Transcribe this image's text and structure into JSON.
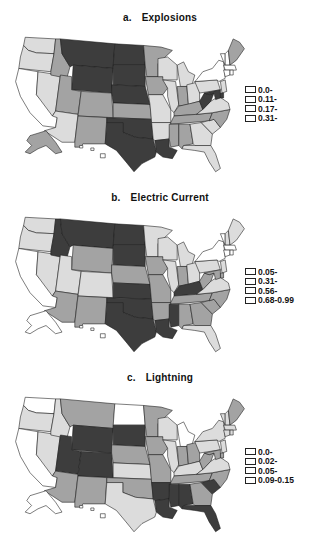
{
  "chart_data": [
    {
      "type": "choropleth-map",
      "panel": "a",
      "title": "Explosions",
      "legend": [
        "0.0-",
        "0.11-",
        "0.17-",
        "0.31-"
      ],
      "legend_colors": [
        "#ffffff",
        "#dcdcdc",
        "#a3a3a3",
        "#3d3d3d"
      ],
      "classes": {
        "WA": 1,
        "OR": 1,
        "CA": 0,
        "NV": 1,
        "ID": 2,
        "MT": 3,
        "WY": 3,
        "UT": 2,
        "AZ": 1,
        "CO": 2,
        "NM": 2,
        "ND": 3,
        "SD": 3,
        "NE": 3,
        "KS": 2,
        "OK": 3,
        "TX": 3,
        "MN": 2,
        "IA": 2,
        "MO": 1,
        "AR": 1,
        "LA": 3,
        "WI": 1,
        "IL": 1,
        "MI": 1,
        "IN": 2,
        "OH": 1,
        "KY": 2,
        "TN": 2,
        "MS": 2,
        "AL": 2,
        "GA": 1,
        "FL": 1,
        "SC": 1,
        "NC": 2,
        "VA": 1,
        "WV": 3,
        "PA": 1,
        "NY": 0,
        "VT": 0,
        "NH": 0,
        "ME": 2,
        "MA": 0,
        "CT": 0,
        "RI": 0,
        "NJ": 1,
        "DE": 3,
        "MD": 3,
        "AK": 2,
        "HI": 0
      }
    },
    {
      "type": "choropleth-map",
      "panel": "b",
      "title": "Electric Current",
      "legend": [
        "0.05-",
        "0.31-",
        "0.56-",
        "0.68-0.99"
      ],
      "legend_colors": [
        "#ffffff",
        "#dcdcdc",
        "#a3a3a3",
        "#3d3d3d"
      ],
      "classes": {
        "WA": 1,
        "OR": 1,
        "CA": 0,
        "NV": 1,
        "ID": 3,
        "MT": 3,
        "WY": 2,
        "UT": 1,
        "AZ": 2,
        "CO": 1,
        "NM": 2,
        "ND": 3,
        "SD": 3,
        "NE": 2,
        "KS": 3,
        "OK": 3,
        "TX": 3,
        "MN": 1,
        "IA": 2,
        "MO": 2,
        "AR": 2,
        "LA": 3,
        "WI": 1,
        "IL": 1,
        "MI": 1,
        "IN": 2,
        "OH": 1,
        "KY": 3,
        "TN": 2,
        "MS": 3,
        "AL": 2,
        "GA": 2,
        "FL": 1,
        "SC": 2,
        "NC": 2,
        "VA": 1,
        "WV": 2,
        "PA": 1,
        "NY": 0,
        "VT": 0,
        "NH": 1,
        "ME": 1,
        "MA": 0,
        "CT": 0,
        "RI": 0,
        "NJ": 1,
        "DE": 2,
        "MD": 2,
        "AK": 0,
        "HI": 0
      }
    },
    {
      "type": "choropleth-map",
      "panel": "c",
      "title": "Lightning",
      "legend": [
        "0.0-",
        "0.02-",
        "0.05-",
        "0.09-0.15"
      ],
      "legend_colors": [
        "#ffffff",
        "#dcdcdc",
        "#a3a3a3",
        "#3d3d3d"
      ],
      "classes": {
        "WA": 0,
        "OR": 1,
        "CA": 0,
        "NV": 1,
        "ID": 1,
        "MT": 2,
        "WY": 3,
        "UT": 3,
        "AZ": 2,
        "CO": 3,
        "NM": 2,
        "ND": 0,
        "SD": 3,
        "NE": 2,
        "KS": 1,
        "OK": 2,
        "TX": 1,
        "MN": 2,
        "IA": 2,
        "MO": 2,
        "AR": 3,
        "LA": 3,
        "WI": 1,
        "IL": 1,
        "MI": 0,
        "IN": 2,
        "OH": 2,
        "KY": 1,
        "TN": 2,
        "MS": 3,
        "AL": 3,
        "GA": 2,
        "FL": 3,
        "SC": 3,
        "NC": 2,
        "VA": 1,
        "WV": 2,
        "PA": 1,
        "NY": 1,
        "VT": 1,
        "NH": 1,
        "ME": 2,
        "MA": 1,
        "CT": 1,
        "RI": 1,
        "NJ": 1,
        "DE": 2,
        "MD": 2,
        "AK": 0,
        "HI": 0
      }
    }
  ],
  "panels": [
    {
      "letter": "a.",
      "title": "Explosions",
      "legend": [
        "0.0-",
        "0.11-",
        "0.17-",
        "0.31-"
      ]
    },
    {
      "letter": "b.",
      "title": "Electric Current",
      "legend": [
        "0.05-",
        "0.31-",
        "0.56-",
        "0.68-0.99"
      ]
    },
    {
      "letter": "c.",
      "title": "Lightning",
      "legend": [
        "0.0-",
        "0.02-",
        "0.05-",
        "0.09-0.15"
      ]
    }
  ]
}
